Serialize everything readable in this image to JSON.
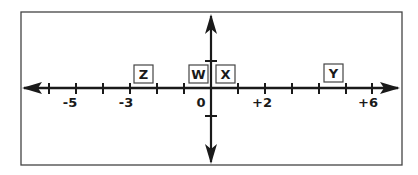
{
  "diagram": {
    "type": "number-line",
    "colors": {
      "line": "#1a1a1a",
      "frame": "#444444",
      "background": "#ffffff"
    },
    "tick_values": [
      -6,
      -5,
      -4,
      -3,
      -2,
      -1,
      0,
      1,
      2,
      3,
      4,
      5,
      6
    ],
    "tick_labels": [
      {
        "value": -5,
        "text": "-5"
      },
      {
        "value": -3,
        "text": "-3"
      },
      {
        "value": 0,
        "text": "0"
      },
      {
        "value": 2,
        "text": "+2"
      },
      {
        "value": 6,
        "text": "+6"
      }
    ],
    "points": [
      {
        "name": "Z",
        "text": "Z",
        "approx_value": -2.5
      },
      {
        "name": "W",
        "text": "W",
        "approx_value": -0.5
      },
      {
        "name": "X",
        "text": "X",
        "approx_value": 0.5
      },
      {
        "name": "Y",
        "text": "Y",
        "approx_value": 4.5
      }
    ]
  },
  "labels": {
    "tick_m5": "-5",
    "tick_m3": "-3",
    "tick_0": "0",
    "tick_p2": "+2",
    "tick_p6": "+6",
    "point_z": "Z",
    "point_w": "W",
    "point_x": "X",
    "point_y": "Y"
  }
}
